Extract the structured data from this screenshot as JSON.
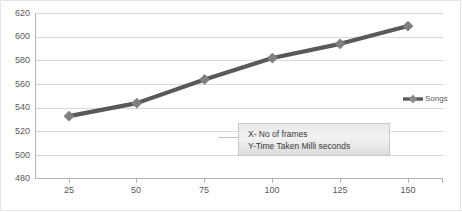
{
  "chart_data": {
    "type": "line",
    "title": "",
    "subtitle": "",
    "xlabel": "",
    "ylabel": "",
    "x": [
      25,
      50,
      75,
      100,
      125,
      150
    ],
    "categories": [
      "25",
      "50",
      "75",
      "100",
      "125",
      "150"
    ],
    "series": [
      {
        "name": "Songs",
        "values": [
          533,
          544,
          564,
          582,
          594,
          609
        ],
        "color": "#595959",
        "marker": "diamond",
        "marker_color": "#808080"
      }
    ],
    "ylim": [
      480,
      620
    ],
    "yticks": [
      480,
      500,
      520,
      540,
      560,
      580,
      600,
      620
    ],
    "ytick_labels": [
      "480",
      "500",
      "520",
      "540",
      "560",
      "580",
      "600",
      "620"
    ],
    "xtick_labels": [
      "25",
      "50",
      "75",
      "100",
      "125",
      "150"
    ],
    "grid": "horizontal",
    "legend_position": "right",
    "annotations": [
      "X- No of frames",
      "Y-Time Taken Milli seconds"
    ],
    "colors": {
      "line": "#595959",
      "marker": "#808080",
      "gridline": "#d9d9d9",
      "axis": "#b3b3b3",
      "text": "#595959",
      "annotation_text": "#3a3a3a",
      "annotation_bg": "#ececec",
      "annotation_border": "#c8c8c8",
      "background": "#ffffff"
    }
  },
  "legend": {
    "items": [
      {
        "label": "Songs"
      }
    ]
  },
  "annotation": {
    "line1": "X- No of frames",
    "line2": "Y-Time Taken Milli seconds"
  }
}
